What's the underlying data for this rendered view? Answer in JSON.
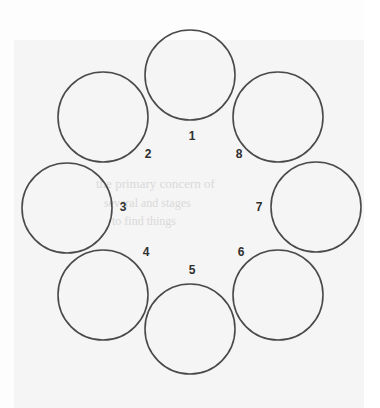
{
  "page": {
    "background_color": "#fdfdfd",
    "paper_tint_color": "#f3f3f3",
    "stroke_color": "#4a4a4a",
    "label_color": "#2f2f2f",
    "ghost_text_color": "#d9d9d9"
  },
  "diagram": {
    "type": "ring-of-circles",
    "circle_count": 8,
    "ring_center_x": 190,
    "ring_center_y": 202,
    "ring_radius": 123,
    "circle_radius": 45,
    "stroke_width": 1.6,
    "nodes": [
      {
        "label": "1",
        "cx": 190,
        "cy": 75,
        "label_x": 185,
        "label_y": 130
      },
      {
        "label": "2",
        "cx": 103,
        "cy": 117,
        "label_x": 141,
        "label_y": 148
      },
      {
        "label": "3",
        "cx": 67,
        "cy": 208,
        "label_x": 116,
        "label_y": 201
      },
      {
        "label": "4",
        "cx": 103,
        "cy": 295,
        "label_x": 139,
        "label_y": 246
      },
      {
        "label": "5",
        "cx": 190,
        "cy": 329,
        "label_x": 185,
        "label_y": 264
      },
      {
        "label": "6",
        "cx": 278,
        "cy": 295,
        "label_x": 234,
        "label_y": 246
      },
      {
        "label": "7",
        "cx": 316,
        "cy": 207,
        "label_x": 252,
        "label_y": 201
      },
      {
        "label": "8",
        "cx": 278,
        "cy": 117,
        "label_x": 232,
        "label_y": 148
      }
    ]
  },
  "ghost_text": [
    {
      "text": "the primary concern of",
      "x": 96,
      "y": 176,
      "size": 13
    },
    {
      "text": "several and stages",
      "x": 104,
      "y": 196,
      "size": 12
    },
    {
      "text": "to find things",
      "x": 112,
      "y": 214,
      "size": 12
    }
  ]
}
